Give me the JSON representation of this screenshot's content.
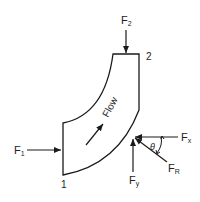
{
  "diagram": {
    "labels": {
      "f1": "F",
      "f1_sub": "1",
      "f2": "F",
      "f2_sub": "2",
      "section1": "1",
      "section2": "2",
      "flow": "Flow",
      "fx": "F",
      "fx_sub": "x",
      "fy": "F",
      "fy_sub": "y",
      "fr": "F",
      "fr_sub": "R",
      "theta": "θ"
    },
    "colors": {
      "stroke": "#1a1a1a",
      "background": "#ffffff"
    }
  }
}
